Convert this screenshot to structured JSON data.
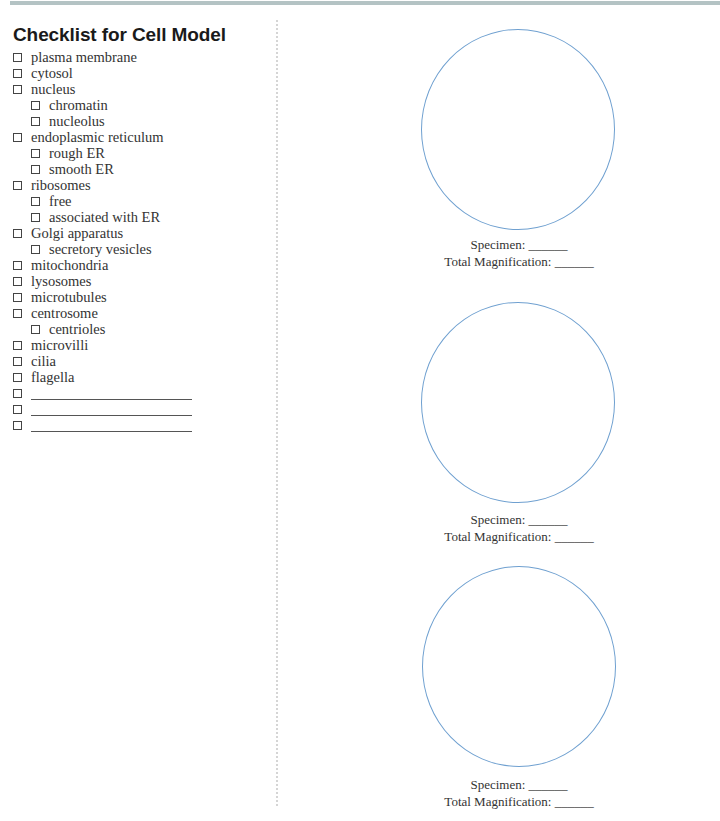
{
  "title": "Checklist for Cell Model",
  "checklist": [
    {
      "label": "plasma membrane",
      "level": 0
    },
    {
      "label": "cytosol",
      "level": 0
    },
    {
      "label": "nucleus",
      "level": 0
    },
    {
      "label": "chromatin",
      "level": 1
    },
    {
      "label": "nucleolus",
      "level": 1
    },
    {
      "label": "endoplasmic reticulum",
      "level": 0
    },
    {
      "label": "rough ER",
      "level": 1
    },
    {
      "label": "smooth ER",
      "level": 1
    },
    {
      "label": "ribosomes",
      "level": 0
    },
    {
      "label": "free",
      "level": 1
    },
    {
      "label": "associated with ER",
      "level": 1
    },
    {
      "label": "Golgi apparatus",
      "level": 0
    },
    {
      "label": "secretory vesicles",
      "level": 1
    },
    {
      "label": "mitochondria",
      "level": 0
    },
    {
      "label": "lysosomes",
      "level": 0
    },
    {
      "label": "microtubules",
      "level": 0
    },
    {
      "label": "centrosome",
      "level": 0
    },
    {
      "label": "centrioles",
      "level": 1
    },
    {
      "label": "microvilli",
      "level": 0
    },
    {
      "label": "cilia",
      "level": 0
    },
    {
      "label": "flagella",
      "level": 0
    },
    {
      "label": "",
      "level": 0,
      "blank": true
    },
    {
      "label": "",
      "level": 0,
      "blank": true
    },
    {
      "label": "",
      "level": 0,
      "blank": true
    }
  ],
  "fields": [
    {
      "specimen": "Specimen: ______",
      "magnification": "Total Magnification: ______"
    },
    {
      "specimen": "Specimen: ______",
      "magnification": "Total Magnification: ______"
    },
    {
      "specimen": "Specimen: ______",
      "magnification": "Total Magnification: ______"
    }
  ],
  "colors": {
    "top_rule": "#b4c3c4",
    "circle_stroke": "#6fa0d0"
  }
}
